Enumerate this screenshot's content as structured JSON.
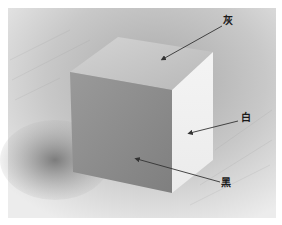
{
  "image": {
    "description": "Pencil sketch of a cube illustrating light values on its faces",
    "background_color": "#ffffff",
    "paper_tone": "#d9d9d9"
  },
  "labels": [
    {
      "id": "top",
      "text": "灰",
      "meaning": "gray",
      "face": "top"
    },
    {
      "id": "right",
      "text": "白",
      "meaning": "white",
      "face": "right"
    },
    {
      "id": "front",
      "text": "黑",
      "meaning": "black",
      "face": "front"
    }
  ],
  "colors": {
    "top_face": "#c4c4c4",
    "front_face": "#8e8e8e",
    "right_face": "#f2f2f2",
    "cast_shadow": "#8a8a8a",
    "background_dark": "#9a9a9a",
    "arrow": "#333333"
  }
}
